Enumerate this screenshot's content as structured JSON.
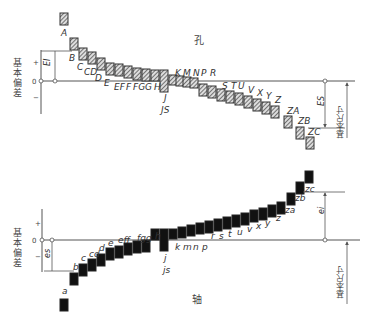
{
  "hole_diagram": {
    "title": "孔",
    "axis_label": "基本偏差",
    "sign_plus": "+",
    "sign_zero": "0",
    "sign_minus": "−",
    "lower_dev_label": "EI",
    "upper_dev_label": "ES",
    "basic_size_label": "基本尺寸",
    "bars": [
      {
        "label": "A",
        "x": 60,
        "top": 13,
        "h": 12
      },
      {
        "label": "B",
        "x": 70,
        "top": 38,
        "h": 12
      },
      {
        "label": "C",
        "x": 79,
        "top": 48,
        "h": 12
      },
      {
        "label": "CD",
        "x": 88,
        "top": 52,
        "h": 12
      },
      {
        "label": "D",
        "x": 97,
        "top": 58,
        "h": 12
      },
      {
        "label": "E",
        "x": 106,
        "top": 63,
        "h": 12
      },
      {
        "label": "EF",
        "x": 115,
        "top": 64,
        "h": 12
      },
      {
        "label": "F",
        "x": 124,
        "top": 66,
        "h": 12
      },
      {
        "label": "FG",
        "x": 133,
        "top": 68,
        "h": 12
      },
      {
        "label": "G",
        "x": 142,
        "top": 69,
        "h": 12
      },
      {
        "label": "H",
        "x": 151,
        "top": 70,
        "h": 11
      },
      {
        "label": "JS",
        "x": 160,
        "top": 70,
        "h": 22
      },
      {
        "label": "J",
        "x": 169,
        "top": 75,
        "h": 10
      },
      {
        "label": "K",
        "x": 176,
        "top": 76,
        "h": 10
      },
      {
        "label": "M",
        "x": 183,
        "top": 77,
        "h": 10
      },
      {
        "label": "N",
        "x": 190,
        "top": 78,
        "h": 10
      },
      {
        "label": "P",
        "x": 199,
        "top": 84,
        "h": 12
      },
      {
        "label": "R",
        "x": 208,
        "top": 86,
        "h": 12
      },
      {
        "label": "S",
        "x": 217,
        "top": 89,
        "h": 12
      },
      {
        "label": "T",
        "x": 226,
        "top": 91,
        "h": 12
      },
      {
        "label": "U",
        "x": 235,
        "top": 93,
        "h": 12
      },
      {
        "label": "V",
        "x": 244,
        "top": 96,
        "h": 12
      },
      {
        "label": "X",
        "x": 253,
        "top": 99,
        "h": 12
      },
      {
        "label": "Y",
        "x": 262,
        "top": 102,
        "h": 12
      },
      {
        "label": "Z",
        "x": 271,
        "top": 106,
        "h": 12
      },
      {
        "label": "ZA",
        "x": 284,
        "top": 116,
        "h": 12
      },
      {
        "label": "ZB",
        "x": 296,
        "top": 127,
        "h": 12
      },
      {
        "label": "ZC",
        "x": 306,
        "top": 137,
        "h": 12
      }
    ],
    "text_labels": [
      {
        "text": "A",
        "x": 61,
        "y": 36
      },
      {
        "text": "B",
        "x": 69,
        "y": 61
      },
      {
        "text": "C",
        "x": 77,
        "y": 70
      },
      {
        "text": "CD",
        "x": 84,
        "y": 75
      },
      {
        "text": "D",
        "x": 95,
        "y": 81
      },
      {
        "text": "E",
        "x": 104,
        "y": 86
      },
      {
        "text": "EF",
        "x": 114,
        "y": 90
      },
      {
        "text": "F",
        "x": 126,
        "y": 90
      },
      {
        "text": "FG",
        "x": 133,
        "y": 90
      },
      {
        "text": "G",
        "x": 145,
        "y": 90
      },
      {
        "text": "H",
        "x": 154,
        "y": 90
      },
      {
        "text": "J",
        "x": 164,
        "y": 101
      },
      {
        "text": "JS",
        "x": 161,
        "y": 113
      },
      {
        "text": "K",
        "x": 175,
        "y": 76
      },
      {
        "text": "M",
        "x": 183,
        "y": 76
      },
      {
        "text": "N",
        "x": 193,
        "y": 76
      },
      {
        "text": "P",
        "x": 201,
        "y": 76
      },
      {
        "text": "R",
        "x": 210,
        "y": 76
      },
      {
        "text": "S",
        "x": 222,
        "y": 89
      },
      {
        "text": "T",
        "x": 231,
        "y": 89
      },
      {
        "text": "U",
        "x": 238,
        "y": 89
      },
      {
        "text": "V",
        "x": 248,
        "y": 93
      },
      {
        "text": "X",
        "x": 257,
        "y": 96
      },
      {
        "text": "Y",
        "x": 266,
        "y": 99
      },
      {
        "text": "Z",
        "x": 275,
        "y": 103
      },
      {
        "text": "ZA",
        "x": 287,
        "y": 114
      },
      {
        "text": "ZB",
        "x": 298,
        "y": 124
      },
      {
        "text": "ZC",
        "x": 308,
        "y": 135
      }
    ]
  },
  "shaft_diagram": {
    "title": "轴",
    "axis_label": "基本偏差",
    "sign_plus": "+",
    "sign_zero": "0",
    "sign_minus": "−",
    "upper_dev_label": "es",
    "lower_dev_label": "ei",
    "basic_size_label": "基本尺寸",
    "bars": [
      {
        "label": "a",
        "x": 60,
        "top": 299,
        "h": 12
      },
      {
        "label": "b",
        "x": 70,
        "top": 273,
        "h": 12
      },
      {
        "label": "c",
        "x": 79,
        "top": 264,
        "h": 12
      },
      {
        "label": "cd",
        "x": 88,
        "top": 259,
        "h": 12
      },
      {
        "label": "d",
        "x": 97,
        "top": 254,
        "h": 12
      },
      {
        "label": "e",
        "x": 106,
        "top": 248,
        "h": 12
      },
      {
        "label": "ef",
        "x": 115,
        "top": 246,
        "h": 12
      },
      {
        "label": "f",
        "x": 124,
        "top": 243,
        "h": 12
      },
      {
        "label": "fg",
        "x": 133,
        "top": 241,
        "h": 12
      },
      {
        "label": "g",
        "x": 142,
        "top": 240,
        "h": 12
      },
      {
        "label": "h",
        "x": 151,
        "top": 229,
        "h": 11
      },
      {
        "label": "js",
        "x": 160,
        "top": 229,
        "h": 22
      },
      {
        "label": "j",
        "x": 169,
        "top": 229,
        "h": 10
      },
      {
        "label": "k",
        "x": 178,
        "top": 227,
        "h": 11
      },
      {
        "label": "m",
        "x": 187,
        "top": 225,
        "h": 11
      },
      {
        "label": "n",
        "x": 196,
        "top": 223,
        "h": 11
      },
      {
        "label": "p",
        "x": 205,
        "top": 221,
        "h": 12
      },
      {
        "label": "r",
        "x": 214,
        "top": 219,
        "h": 12
      },
      {
        "label": "s",
        "x": 223,
        "top": 217,
        "h": 12
      },
      {
        "label": "t",
        "x": 232,
        "top": 215,
        "h": 12
      },
      {
        "label": "u",
        "x": 241,
        "top": 213,
        "h": 12
      },
      {
        "label": "v",
        "x": 250,
        "top": 210,
        "h": 12
      },
      {
        "label": "x",
        "x": 259,
        "top": 208,
        "h": 12
      },
      {
        "label": "y",
        "x": 268,
        "top": 205,
        "h": 12
      },
      {
        "label": "z",
        "x": 277,
        "top": 202,
        "h": 12
      },
      {
        "label": "za",
        "x": 287,
        "top": 193,
        "h": 12
      },
      {
        "label": "zb",
        "x": 296,
        "top": 182,
        "h": 12
      },
      {
        "label": "zc",
        "x": 305,
        "top": 171,
        "h": 12
      }
    ],
    "text_labels": [
      {
        "text": "a",
        "x": 62,
        "y": 294
      },
      {
        "text": "b",
        "x": 73,
        "y": 270
      },
      {
        "text": "c",
        "x": 81,
        "y": 261
      },
      {
        "text": "cd",
        "x": 89,
        "y": 257
      },
      {
        "text": "d",
        "x": 99,
        "y": 251
      },
      {
        "text": "e",
        "x": 108,
        "y": 246
      },
      {
        "text": "eff",
        "x": 118,
        "y": 243
      },
      {
        "text": "fgg",
        "x": 137,
        "y": 241
      },
      {
        "text": "h",
        "x": 155,
        "y": 239
      },
      {
        "text": "j",
        "x": 164,
        "y": 261
      },
      {
        "text": "js",
        "x": 163,
        "y": 273
      },
      {
        "text": "k",
        "x": 175,
        "y": 250
      },
      {
        "text": "m",
        "x": 183,
        "y": 250
      },
      {
        "text": "n",
        "x": 193,
        "y": 250
      },
      {
        "text": "p",
        "x": 202,
        "y": 250
      },
      {
        "text": "r",
        "x": 211,
        "y": 239
      },
      {
        "text": "s",
        "x": 219,
        "y": 239
      },
      {
        "text": "t",
        "x": 228,
        "y": 237
      },
      {
        "text": "u",
        "x": 237,
        "y": 235
      },
      {
        "text": "v",
        "x": 247,
        "y": 232
      },
      {
        "text": "x",
        "x": 256,
        "y": 229
      },
      {
        "text": "y",
        "x": 265,
        "y": 226
      },
      {
        "text": "z",
        "x": 276,
        "y": 221
      },
      {
        "text": "za",
        "x": 285,
        "y": 213
      },
      {
        "text": "zb",
        "x": 295,
        "y": 201
      },
      {
        "text": "zc",
        "x": 305,
        "y": 192
      }
    ]
  },
  "colors": {
    "line": "#555555",
    "hatch_fill": "#777777",
    "shaft_fill": "#111111",
    "text": "#444444"
  }
}
